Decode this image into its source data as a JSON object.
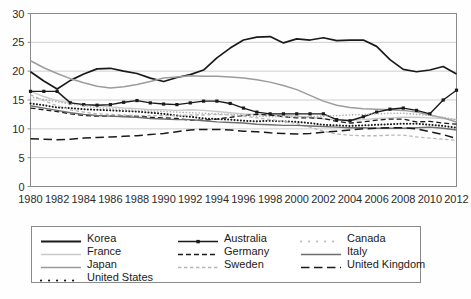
{
  "chart_data": {
    "type": "line",
    "title": "",
    "xlabel": "",
    "ylabel": "",
    "xlim": [
      1980,
      2012
    ],
    "ylim": [
      0,
      30
    ],
    "ytick_values": [
      0,
      5,
      10,
      15,
      20,
      25,
      30
    ],
    "ytick_labels": [
      "0",
      "5",
      "10",
      "15",
      "20",
      "25",
      "30"
    ],
    "xtick_values": [
      1980,
      1982,
      1984,
      1986,
      1988,
      1990,
      1992,
      1994,
      1996,
      1998,
      2000,
      2002,
      2004,
      2006,
      2008,
      2010,
      2012
    ],
    "xtick_labels": [
      "1980",
      "1982",
      "1984",
      "1986",
      "1988",
      "1990",
      "1992",
      "1994",
      "1996",
      "1998",
      "2000",
      "2002",
      "2004",
      "2006",
      "2008",
      "2010",
      "2012"
    ],
    "grid": "horizontal",
    "legend_position": "below",
    "x": [
      1980,
      1981,
      1982,
      1983,
      1984,
      1985,
      1986,
      1987,
      1988,
      1989,
      1990,
      1991,
      1992,
      1993,
      1994,
      1995,
      1996,
      1997,
      1998,
      1999,
      2000,
      2001,
      2002,
      2003,
      2004,
      2005,
      2006,
      2007,
      2008,
      2009,
      2010,
      2011,
      2012
    ],
    "series": [
      {
        "name": "Korea",
        "style": "solid",
        "color": "#1a1a1a",
        "width": 1.7,
        "marker": "none",
        "values": [
          19.9,
          18.3,
          16.9,
          18.4,
          19.5,
          20.4,
          20.5,
          20.0,
          19.6,
          18.8,
          18.2,
          18.9,
          19.4,
          20.2,
          22.3,
          24.0,
          25.4,
          25.9,
          26.0,
          24.9,
          25.6,
          25.4,
          25.8,
          25.3,
          25.4,
          25.4,
          24.3,
          22.0,
          20.3,
          19.9,
          20.2,
          20.8,
          19.5
        ]
      },
      {
        "name": "France",
        "style": "solid",
        "color": "#c9c9c9",
        "width": 1.4,
        "marker": "none",
        "values": [
          16.5,
          15.6,
          14.9,
          14.5,
          14.2,
          14.1,
          13.8,
          13.6,
          13.5,
          13.3,
          13.3,
          13.2,
          13.3,
          13.2,
          13.0,
          12.8,
          12.6,
          12.5,
          12.4,
          12.3,
          12.2,
          12.0,
          11.7,
          11.6,
          11.5,
          11.6,
          11.8,
          11.9,
          12.0,
          12.0,
          11.9,
          11.8,
          11.6
        ]
      },
      {
        "name": "Japan",
        "style": "solid",
        "color": "#9c9c9c",
        "width": 1.5,
        "marker": "none",
        "values": [
          21.8,
          20.6,
          19.6,
          18.7,
          18.0,
          17.4,
          17.1,
          17.3,
          17.7,
          18.2,
          18.8,
          19.0,
          19.2,
          19.1,
          19.1,
          19.0,
          18.8,
          18.5,
          18.1,
          17.5,
          16.8,
          15.8,
          14.8,
          14.1,
          13.7,
          13.5,
          13.4,
          13.3,
          13.2,
          12.9,
          12.4,
          11.9,
          11.2
        ]
      },
      {
        "name": "United States",
        "style": "dotted",
        "color": "#1a1a1a",
        "width": 2.0,
        "marker": "none",
        "values": [
          14.4,
          14.1,
          13.7,
          13.6,
          13.4,
          13.3,
          13.2,
          13.1,
          13.0,
          12.8,
          12.6,
          12.3,
          12.1,
          11.8,
          11.7,
          11.6,
          11.4,
          11.3,
          11.4,
          11.3,
          11.2,
          11.0,
          10.7,
          10.6,
          10.5,
          10.6,
          10.7,
          10.8,
          10.9,
          10.9,
          10.7,
          10.5,
          10.2
        ]
      },
      {
        "name": "Australia",
        "style": "solid",
        "color": "#1a1a1a",
        "width": 1.4,
        "marker": "square",
        "values": [
          16.5,
          16.5,
          16.5,
          14.5,
          14.2,
          14.1,
          14.2,
          14.6,
          14.9,
          14.5,
          14.3,
          14.2,
          14.5,
          14.8,
          14.8,
          14.4,
          13.6,
          12.9,
          12.6,
          12.6,
          12.6,
          12.6,
          12.6,
          11.6,
          11.4,
          12.1,
          12.9,
          13.4,
          13.6,
          13.2,
          12.6,
          15.0,
          16.7
        ]
      },
      {
        "name": "Germany",
        "style": "dashed",
        "color": "#1a1a1a",
        "width": 1.3,
        "marker": "none",
        "values": [
          13.6,
          13.3,
          13.0,
          12.6,
          12.3,
          12.2,
          12.2,
          12.2,
          12.2,
          12.0,
          11.9,
          11.8,
          11.5,
          11.5,
          11.7,
          12.0,
          12.3,
          12.5,
          12.4,
          12.1,
          11.9,
          11.9,
          11.8,
          11.3,
          11.0,
          11.2,
          11.5,
          11.7,
          11.7,
          11.2,
          11.3,
          11.0,
          10.8
        ]
      },
      {
        "name": "Sweden",
        "style": "finedash",
        "color": "#b5b5b5",
        "width": 1.3,
        "marker": "none",
        "values": [
          15.9,
          14.9,
          14.0,
          13.3,
          12.9,
          12.6,
          12.5,
          12.4,
          12.3,
          12.3,
          12.3,
          12.3,
          12.4,
          12.4,
          12.5,
          12.4,
          12.2,
          11.9,
          11.6,
          11.3,
          10.9,
          10.3,
          9.6,
          9.1,
          8.9,
          8.8,
          8.8,
          8.9,
          8.9,
          8.6,
          8.4,
          8.2,
          8.0
        ]
      },
      {
        "name": "Canada",
        "style": "dotted",
        "color": "#b0b0b0",
        "width": 1.6,
        "marker": "none",
        "values": [
          15.5,
          15.1,
          14.7,
          14.3,
          14.0,
          13.7,
          13.5,
          13.3,
          13.2,
          13.1,
          13.0,
          12.9,
          12.8,
          12.7,
          12.6,
          12.5,
          12.4,
          12.2,
          12.1,
          12.1,
          12.1,
          12.1,
          12.2,
          12.3,
          12.4,
          12.5,
          12.6,
          12.7,
          12.7,
          12.5,
          12.3,
          12.0,
          11.6
        ]
      },
      {
        "name": "Italy",
        "style": "solid",
        "color": "#6e6e6e",
        "width": 1.4,
        "marker": "none",
        "values": [
          14.0,
          13.6,
          13.2,
          12.8,
          12.5,
          12.3,
          12.2,
          12.1,
          12.0,
          11.8,
          11.7,
          11.6,
          11.6,
          11.4,
          11.2,
          11.1,
          11.0,
          10.8,
          10.7,
          10.6,
          10.6,
          10.5,
          10.4,
          10.3,
          10.2,
          10.2,
          10.1,
          10.1,
          10.1,
          10.2,
          10.3,
          10.1,
          9.8
        ]
      },
      {
        "name": "United Kingdom",
        "style": "longdash",
        "color": "#1a1a1a",
        "width": 1.5,
        "marker": "none",
        "values": [
          8.3,
          8.2,
          8.1,
          8.2,
          8.4,
          8.5,
          8.6,
          8.7,
          8.8,
          9.0,
          9.2,
          9.5,
          9.8,
          9.9,
          9.9,
          9.8,
          9.6,
          9.5,
          9.3,
          9.2,
          9.1,
          9.2,
          9.4,
          9.6,
          9.8,
          10.0,
          10.1,
          10.2,
          10.2,
          10.0,
          9.5,
          9.0,
          8.3
        ]
      }
    ]
  },
  "legend": {
    "items": [
      {
        "label": "Korea",
        "style": "solid",
        "color": "#1a1a1a",
        "marker": "none",
        "width": 1.9,
        "col": 0,
        "row": 0
      },
      {
        "label": "Australia",
        "style": "solid",
        "color": "#1a1a1a",
        "marker": "square",
        "width": 1.5,
        "col": 1,
        "row": 0
      },
      {
        "label": "Canada",
        "style": "dotted",
        "color": "#b0b0b0",
        "marker": "none",
        "width": 1.8,
        "col": 2,
        "row": 0
      },
      {
        "label": "France",
        "style": "solid",
        "color": "#c9c9c9",
        "marker": "none",
        "width": 1.5,
        "col": 0,
        "row": 1
      },
      {
        "label": "Germany",
        "style": "dashed",
        "color": "#1a1a1a",
        "marker": "none",
        "width": 1.5,
        "col": 1,
        "row": 1
      },
      {
        "label": "Italy",
        "style": "solid",
        "color": "#6e6e6e",
        "marker": "none",
        "width": 1.5,
        "col": 2,
        "row": 1
      },
      {
        "label": "Japan",
        "style": "solid",
        "color": "#9c9c9c",
        "marker": "none",
        "width": 1.5,
        "col": 0,
        "row": 2
      },
      {
        "label": "Sweden",
        "style": "finedash",
        "color": "#b5b5b5",
        "marker": "none",
        "width": 1.4,
        "col": 1,
        "row": 2
      },
      {
        "label": "United Kingdom",
        "style": "longdash",
        "color": "#1a1a1a",
        "marker": "none",
        "width": 1.6,
        "col": 2,
        "row": 2
      },
      {
        "label": "United States",
        "style": "dotted",
        "color": "#1a1a1a",
        "marker": "none",
        "width": 2.2,
        "col": 0,
        "row": 3
      }
    ]
  },
  "axes": {
    "frame_color": "#8a8a8a",
    "grid_color": "#cfcfcf",
    "tick_color": "#8a8a8a"
  }
}
